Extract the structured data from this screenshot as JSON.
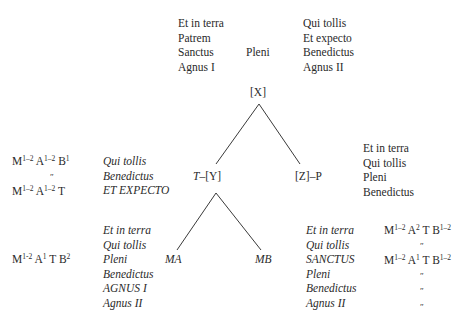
{
  "top": {
    "left_column": [
      "Et in terra",
      "Patrem",
      "Sanctus",
      "Agnus I"
    ],
    "center": "Pleni",
    "right_column": [
      "Qui tollis",
      "Et expecto",
      "Benedictus",
      "Agnus II"
    ]
  },
  "nodes": {
    "root": "[X]",
    "left_child": "T–[Y]",
    "right_child": "[Z]–P",
    "ma": "MA",
    "mb": "MB"
  },
  "zp_sections": [
    "Et in terra",
    "Qui tollis",
    "Pleni",
    "Benedictus"
  ],
  "ty_sections": {
    "sections": [
      "Qui tollis",
      "Benedictus",
      "ET EXPECTO"
    ],
    "formulas": [
      {
        "parts": [
          [
            "M",
            "1–2"
          ],
          [
            "A",
            "1–2"
          ],
          [
            "B",
            "1"
          ]
        ]
      },
      {
        "ditto": "″"
      },
      {
        "parts": [
          [
            "M",
            "1–2"
          ],
          [
            "A",
            "1–2"
          ],
          [
            "T",
            ""
          ]
        ]
      }
    ]
  },
  "ma_sections": {
    "sections": [
      "Et in terra",
      "Qui tollis",
      "Pleni",
      "Benedictus",
      "AGNUS I",
      "Agnus II"
    ],
    "formula": {
      "parts": [
        [
          "M",
          "1-2"
        ],
        [
          "A",
          "1"
        ],
        [
          "T",
          ""
        ],
        [
          "B",
          "2"
        ]
      ]
    }
  },
  "mb_sections": {
    "sections": [
      "Et in terra",
      "Qui tollis",
      "SANCTUS",
      "Pleni",
      "Benedictus",
      "Agnus II"
    ],
    "formulas": [
      {
        "parts": [
          [
            "M",
            "1–2"
          ],
          [
            "A",
            "2"
          ],
          [
            "T",
            ""
          ],
          [
            "B",
            "1–2"
          ]
        ]
      },
      {
        "ditto": "″"
      },
      {
        "parts": [
          [
            "M",
            "1–2"
          ],
          [
            "A",
            "1"
          ],
          [
            "T",
            ""
          ],
          [
            "B",
            "1–2"
          ]
        ]
      },
      {
        "ditto": "″"
      },
      {
        "ditto": "″"
      },
      {
        "ditto": "″"
      }
    ]
  },
  "tree_edges": [
    {
      "from": [
        259,
        104
      ],
      "to": [
        216,
        164
      ]
    },
    {
      "from": [
        259,
        104
      ],
      "to": [
        300,
        164
      ]
    },
    {
      "from": [
        216,
        193
      ],
      "to": [
        177,
        250
      ]
    },
    {
      "from": [
        216,
        193
      ],
      "to": [
        261,
        250
      ]
    }
  ],
  "colors": {
    "ink": "#2a2a2a",
    "background": "#ffffff"
  }
}
